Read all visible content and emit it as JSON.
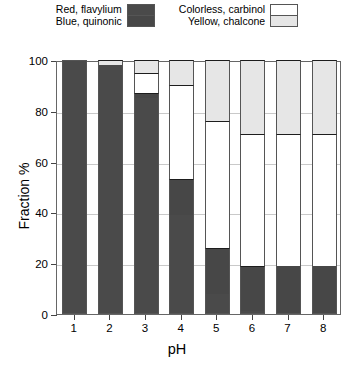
{
  "legend": {
    "groups": [
      {
        "labels": [
          "Red, flavylium",
          "Blue, quinonic"
        ],
        "swatch_colors": [
          "#4a4a4a",
          "#474747"
        ],
        "swatch_names": [
          "red-flavylium-swatch",
          "blue-quinonic-swatch"
        ]
      },
      {
        "labels": [
          "Colorless, carbinol",
          "Yellow, chalcone"
        ],
        "swatch_colors": [
          "#ffffff",
          "#e6e6e6"
        ],
        "swatch_names": [
          "colorless-carbinol-swatch",
          "yellow-chalcone-swatch"
        ]
      }
    ]
  },
  "chart_data": {
    "type": "bar",
    "subtype": "stacked-bar",
    "title": "",
    "xlabel": "pH",
    "ylabel": "Fraction %",
    "categories": [
      "1",
      "2",
      "3",
      "4",
      "5",
      "6",
      "7",
      "8"
    ],
    "xtick_labels": [
      "1",
      "2",
      "3",
      "4",
      "5",
      "6",
      "7",
      "8"
    ],
    "ytick_labels": [
      "0",
      "20",
      "40",
      "60",
      "80",
      "100"
    ],
    "ytick_values": [
      0,
      20,
      40,
      60,
      80,
      100
    ],
    "ylim": [
      0,
      100
    ],
    "grid": true,
    "grid_axis": "y",
    "legend_position": "above-plot",
    "stack_order_bottom_to_top": [
      "Red, flavylium",
      "Blue, quinonic",
      "Colorless, carbinol",
      "Yellow, chalcone"
    ],
    "series": [
      {
        "name": "Red, flavylium",
        "color": "#4a4a4a",
        "values": [
          100,
          98,
          85,
          39,
          8,
          1,
          0,
          0
        ]
      },
      {
        "name": "Blue, quinonic",
        "color": "#474747",
        "values": [
          0,
          0,
          2,
          14,
          18,
          18,
          19,
          19
        ]
      },
      {
        "name": "Colorless, carbinol",
        "color": "#ffffff",
        "values": [
          0,
          0,
          8,
          37,
          50,
          52,
          52,
          52
        ]
      },
      {
        "name": "Yellow, chalcone",
        "color": "#e6e6e6",
        "values": [
          0,
          2,
          5,
          10,
          24,
          29,
          29,
          29
        ]
      }
    ]
  },
  "colors": {
    "red_flavylium": "#4a4a4a",
    "blue_quinonic": "#474747",
    "colorless_carbinol": "#ffffff",
    "yellow_chalcone": "#e6e6e6",
    "axis": "#666666",
    "grid": "#c9c9c9",
    "background": "#ffffff"
  }
}
